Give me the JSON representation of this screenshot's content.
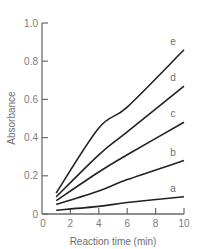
{
  "chart_data": {
    "type": "line",
    "title": "",
    "xlabel": "Reaction time (min)",
    "ylabel": "Absorbance",
    "xlim": [
      0,
      10
    ],
    "ylim": [
      0,
      1.0
    ],
    "x_ticks": [
      "0",
      "2",
      "4",
      "6",
      "8",
      "10"
    ],
    "y_ticks": [
      "0",
      "0.2",
      "0.4",
      "0.6",
      "0.8",
      "1.0"
    ],
    "grid": false,
    "legend": "inline labels at line ends",
    "x": [
      1,
      4,
      6,
      10
    ],
    "series": [
      {
        "name": "a",
        "values": [
          0.02,
          0.04,
          0.06,
          0.09
        ]
      },
      {
        "name": "b",
        "values": [
          0.05,
          0.12,
          0.18,
          0.28
        ]
      },
      {
        "name": "c",
        "values": [
          0.07,
          0.22,
          0.31,
          0.48
        ]
      },
      {
        "name": "d",
        "values": [
          0.09,
          0.31,
          0.43,
          0.67
        ]
      },
      {
        "name": "e",
        "values": [
          0.11,
          0.45,
          0.56,
          0.86
        ]
      }
    ]
  },
  "colors": {
    "line": "#222222",
    "axis": "#6a6a6a",
    "text": "#6e6e6e"
  }
}
